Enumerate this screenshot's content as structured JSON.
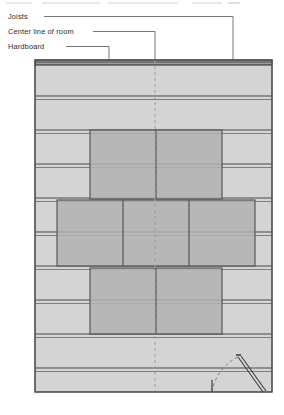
{
  "figure": {
    "domain": "architectural-floor-plan",
    "title_strip_visible": true,
    "background_color": "#ffffff"
  },
  "labels": [
    {
      "id": "joists",
      "text": "Joists",
      "x": 8,
      "y": 16,
      "dash_start_x": 44,
      "dash_end_x": 233,
      "drop_x": 233,
      "drop_y": 62
    },
    {
      "id": "center-line",
      "text": "Center line of room",
      "x": 8,
      "y": 31,
      "dash_start_x": 93,
      "dash_end_x": 155,
      "drop_x": 155,
      "drop_y": 62
    },
    {
      "id": "hardboard",
      "text": "Hardboard",
      "x": 8,
      "y": 46,
      "dash_start_x": 66,
      "dash_end_x": 109,
      "drop_x": 109,
      "drop_y": 62
    }
  ],
  "drawing": {
    "left": 35,
    "right": 272,
    "top": 60,
    "bottom": 392,
    "field_fill": "#d4d4d4",
    "panel_fill": "#b0b0b0",
    "outline_color": "#555555",
    "joist_line_color": "#4a4a4a",
    "center_line_color": "#b09a9a",
    "center_line_x": 155,
    "header_band": {
      "y": 60,
      "height": 5,
      "fill": "#9a9a9a"
    }
  },
  "joists": {
    "label": "Joists",
    "pitch_px": 34,
    "line_y": [
      62,
      96,
      130,
      164,
      198,
      232,
      266,
      300,
      334,
      368
    ],
    "count": 10
  },
  "hardboard_panels": {
    "label": "Hardboard",
    "pattern": "staggered-brick",
    "rows": [
      {
        "id": "upper-row",
        "top": 130,
        "bottom": 199,
        "left": 90,
        "right": 222,
        "splits": [
          156
        ]
      },
      {
        "id": "middle-row",
        "top": 200,
        "bottom": 266,
        "left": 57,
        "right": 255,
        "splits": [
          123,
          189
        ]
      },
      {
        "id": "lower-row",
        "top": 268,
        "bottom": 334,
        "left": 90,
        "right": 222,
        "splits": [
          156
        ]
      }
    ],
    "panel_count": 7
  },
  "door_swing": {
    "id": "door-swing",
    "pivot_x": 238,
    "pivot_y": 357,
    "leaf_end_x": 263,
    "leaf_end_y": 392,
    "arc_end_x": 212,
    "arc_end_y": 392,
    "arc_style": "dashed",
    "leaf_style": "double-line"
  }
}
